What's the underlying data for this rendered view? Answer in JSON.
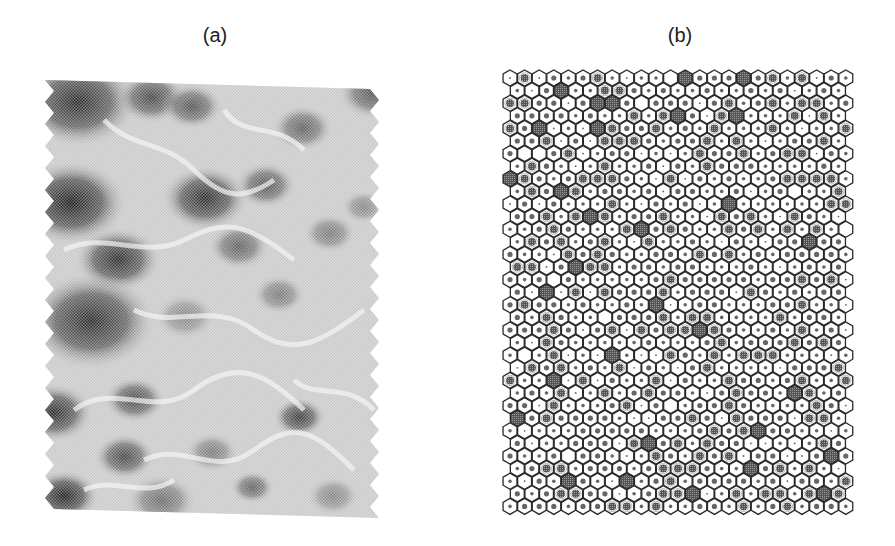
{
  "figure": {
    "panels": [
      {
        "id": "a",
        "label": "(a)",
        "type": "grayscale-field",
        "description": "Halftone grayscale terrain-like field with dark blobs and light ridge lines; zigzag left and right edges",
        "dark_blobs": [
          {
            "x": 0.1,
            "y": 0.05,
            "r": 0.14,
            "v": 0.85
          },
          {
            "x": 0.32,
            "y": 0.04,
            "r": 0.08,
            "v": 0.75
          },
          {
            "x": 0.44,
            "y": 0.06,
            "r": 0.07,
            "v": 0.7
          },
          {
            "x": 0.77,
            "y": 0.11,
            "r": 0.07,
            "v": 0.65
          },
          {
            "x": 0.98,
            "y": 0.03,
            "r": 0.08,
            "v": 0.7
          },
          {
            "x": 0.08,
            "y": 0.28,
            "r": 0.13,
            "v": 0.9
          },
          {
            "x": 0.48,
            "y": 0.27,
            "r": 0.1,
            "v": 0.85
          },
          {
            "x": 0.66,
            "y": 0.24,
            "r": 0.07,
            "v": 0.7
          },
          {
            "x": 0.95,
            "y": 0.29,
            "r": 0.05,
            "v": 0.5
          },
          {
            "x": 0.22,
            "y": 0.41,
            "r": 0.1,
            "v": 0.85
          },
          {
            "x": 0.58,
            "y": 0.38,
            "r": 0.07,
            "v": 0.65
          },
          {
            "x": 0.85,
            "y": 0.35,
            "r": 0.06,
            "v": 0.55
          },
          {
            "x": 0.14,
            "y": 0.55,
            "r": 0.15,
            "v": 0.85
          },
          {
            "x": 0.42,
            "y": 0.54,
            "r": 0.07,
            "v": 0.5
          },
          {
            "x": 0.7,
            "y": 0.49,
            "r": 0.06,
            "v": 0.55
          },
          {
            "x": 0.03,
            "y": 0.76,
            "r": 0.09,
            "v": 0.85
          },
          {
            "x": 0.27,
            "y": 0.73,
            "r": 0.07,
            "v": 0.75
          },
          {
            "x": 0.76,
            "y": 0.77,
            "r": 0.06,
            "v": 0.8
          },
          {
            "x": 0.5,
            "y": 0.85,
            "r": 0.06,
            "v": 0.55
          },
          {
            "x": 0.24,
            "y": 0.86,
            "r": 0.07,
            "v": 0.75
          },
          {
            "x": 0.06,
            "y": 0.95,
            "r": 0.08,
            "v": 0.9
          },
          {
            "x": 0.35,
            "y": 0.96,
            "r": 0.08,
            "v": 0.6
          },
          {
            "x": 0.62,
            "y": 0.93,
            "r": 0.05,
            "v": 0.65
          },
          {
            "x": 0.86,
            "y": 0.95,
            "r": 0.06,
            "v": 0.5
          }
        ]
      },
      {
        "id": "b",
        "label": "(b)",
        "type": "hexagonal-grid",
        "description": "Hexagonal cell lattice; each cell has a central shaded dot of varying size; some cells fully shaded dark, some empty",
        "rows": 35,
        "cols": 24,
        "cell_spacing_x": 14.6,
        "cell_spacing_y": 12.6,
        "fill_levels": {
          "0": "empty",
          "1": "tiny dot",
          "2": "small dot",
          "3": "medium dot",
          "4": "large hatched disc",
          "5": "fully shaded hexagon"
        },
        "full_cells": [
          [
            0,
            12
          ],
          [
            0,
            16
          ],
          [
            1,
            3
          ],
          [
            2,
            6
          ],
          [
            2,
            7
          ],
          [
            3,
            11
          ],
          [
            3,
            15
          ],
          [
            4,
            2
          ],
          [
            4,
            6
          ],
          [
            5,
            23
          ],
          [
            8,
            0
          ],
          [
            9,
            3
          ],
          [
            10,
            15
          ],
          [
            11,
            5
          ],
          [
            12,
            9
          ],
          [
            13,
            20
          ],
          [
            15,
            4
          ],
          [
            17,
            2
          ],
          [
            18,
            10
          ],
          [
            20,
            13
          ],
          [
            22,
            7
          ],
          [
            24,
            3
          ],
          [
            25,
            19
          ],
          [
            27,
            0
          ],
          [
            28,
            17
          ],
          [
            29,
            9
          ],
          [
            30,
            22
          ],
          [
            31,
            16
          ],
          [
            32,
            4
          ],
          [
            32,
            8
          ],
          [
            33,
            12
          ],
          [
            33,
            21
          ]
        ],
        "empty_cells": [
          [
            0,
            11
          ],
          [
            2,
            9
          ],
          [
            6,
            1
          ],
          [
            6,
            2
          ],
          [
            9,
            19
          ],
          [
            12,
            23
          ],
          [
            16,
            3
          ],
          [
            19,
            6
          ],
          [
            22,
            1
          ],
          [
            26,
            11
          ],
          [
            30,
            4
          ]
        ],
        "colors": {
          "outline": "#2a2a2a",
          "fill_dark": "#555555",
          "dot": "#666666",
          "background": "#ffffff"
        }
      }
    ]
  }
}
